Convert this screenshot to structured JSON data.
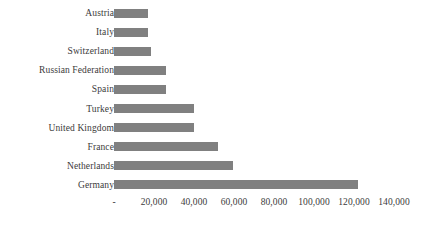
{
  "chart_data": {
    "type": "bar",
    "orientation": "horizontal",
    "title": "",
    "subtitle": "",
    "xlabel": "",
    "ylabel": "",
    "grid": false,
    "legend": false,
    "legend_position": "none",
    "bar_color": "#808080",
    "text_color": "#3b3b3b",
    "background_color": "#ffffff",
    "xlim": [
      0,
      140000
    ],
    "xticks": [
      0,
      20000,
      40000,
      60000,
      80000,
      100000,
      120000,
      140000
    ],
    "xtick_labels": [
      "-",
      "20,000",
      "40,000",
      "60,000",
      "80,000",
      "100,000",
      "120,000",
      "140,000"
    ],
    "categories": [
      "Austria",
      "Italy",
      "Switzerland",
      "Russian Federation",
      "Spain",
      "Turkey",
      "United Kingdom",
      "France",
      "Netherlands",
      "Germany"
    ],
    "values": [
      17000,
      17000,
      18500,
      26000,
      26000,
      40000,
      40000,
      52000,
      59500,
      122000
    ]
  }
}
